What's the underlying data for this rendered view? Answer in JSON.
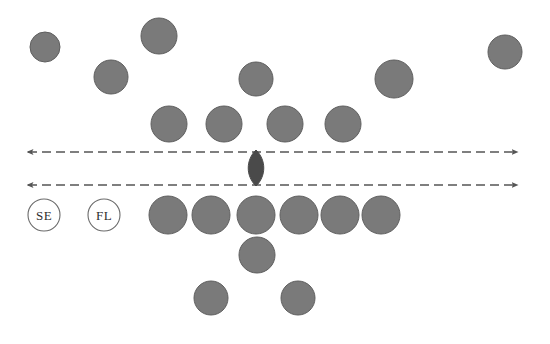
{
  "figure": {
    "width": 550,
    "height": 344,
    "background_color": "#ffffff"
  },
  "style": {
    "marker_fill": "#7a7a7a",
    "marker_stroke": "#5f5f5f",
    "dark_marker_fill": "#4a4a4a",
    "label_circle_fill": "#ffffff",
    "label_circle_stroke": "#6b6b6b",
    "axis_color": "#555555",
    "text_color": "#2e2e2e",
    "dash_pattern": "9 5"
  },
  "axes": [
    {
      "name": "upper-axis",
      "y": 152,
      "x_start": 28,
      "x_end": 518,
      "arrow_left": true,
      "arrow_right": true
    },
    {
      "name": "lower-axis",
      "y": 185,
      "x_start": 28,
      "x_end": 518,
      "arrow_left": true,
      "arrow_right": true
    }
  ],
  "legend": [
    {
      "id": "se",
      "label": "SE",
      "cx": 44,
      "cy": 215,
      "r": 16
    },
    {
      "id": "fl",
      "label": "FL",
      "cx": 104,
      "cy": 215,
      "r": 16
    }
  ],
  "center_marker": {
    "name": "center-lens",
    "cx": 256,
    "cy": 168,
    "rx": 9,
    "ry": 18,
    "fill": "#4a4a4a"
  },
  "markers": {
    "above_upper_axis_scattered": [
      {
        "cx": 45,
        "cy": 47,
        "r": 15
      },
      {
        "cx": 111,
        "cy": 77,
        "r": 17
      },
      {
        "cx": 159,
        "cy": 36,
        "r": 18
      },
      {
        "cx": 256,
        "cy": 79,
        "r": 17
      },
      {
        "cx": 394,
        "cy": 79,
        "r": 19
      },
      {
        "cx": 505,
        "cy": 52,
        "r": 17
      }
    ],
    "row_above_upper_axis": [
      {
        "cx": 169,
        "cy": 124,
        "r": 18
      },
      {
        "cx": 224,
        "cy": 124,
        "r": 18
      },
      {
        "cx": 285,
        "cy": 124,
        "r": 18
      },
      {
        "cx": 343,
        "cy": 124,
        "r": 18
      }
    ],
    "row_below_lower_axis": [
      {
        "cx": 168,
        "cy": 215,
        "r": 19
      },
      {
        "cx": 211,
        "cy": 215,
        "r": 19
      },
      {
        "cx": 256,
        "cy": 215,
        "r": 19
      },
      {
        "cx": 299,
        "cy": 215,
        "r": 19
      },
      {
        "cx": 340,
        "cy": 215,
        "r": 19
      },
      {
        "cx": 381,
        "cy": 215,
        "r": 19
      }
    ],
    "bottom_scattered": [
      {
        "cx": 257,
        "cy": 255,
        "r": 18
      },
      {
        "cx": 211,
        "cy": 298,
        "r": 17
      },
      {
        "cx": 298,
        "cy": 298,
        "r": 17
      }
    ]
  }
}
